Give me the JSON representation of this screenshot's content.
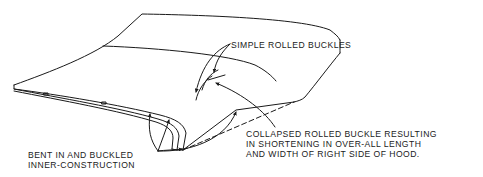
{
  "diagram": {
    "colors": {
      "line": "#1a1a1a",
      "background": "#ffffff"
    },
    "labels": {
      "simple_rolled_buckles": "SIMPLE ROLLED BUCKLES",
      "collapsed": {
        "line1": "COLLAPSED ROLLED BUCKLE RESULTING",
        "line2": "IN SHORTENING IN OVER-ALL LENGTH",
        "line3": "AND WIDTH OF RIGHT SIDE OF HOOD."
      },
      "bent": {
        "line1": "BENT IN AND BUCKLED",
        "line2": "INNER-CONSTRUCTION"
      }
    }
  }
}
